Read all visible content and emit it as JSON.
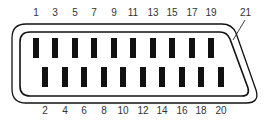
{
  "diagram": {
    "type": "connector-pinout",
    "connector": "SCART",
    "colors": {
      "outline": "#111111",
      "pin": "#111111",
      "label": "#333333",
      "background": "#ffffff"
    },
    "top_row": {
      "labels": [
        "1",
        "3",
        "5",
        "7",
        "9",
        "11",
        "13",
        "15",
        "17",
        "19"
      ],
      "x": [
        36,
        55,
        75,
        94,
        114,
        133,
        153,
        172,
        192,
        211
      ]
    },
    "bottom_row": {
      "labels": [
        "2",
        "4",
        "6",
        "8",
        "10",
        "12",
        "14",
        "16",
        "18",
        "20"
      ],
      "x": [
        45,
        65,
        84,
        104,
        123,
        143,
        162,
        182,
        201,
        221
      ]
    },
    "shield_pin": {
      "label": "21"
    }
  }
}
